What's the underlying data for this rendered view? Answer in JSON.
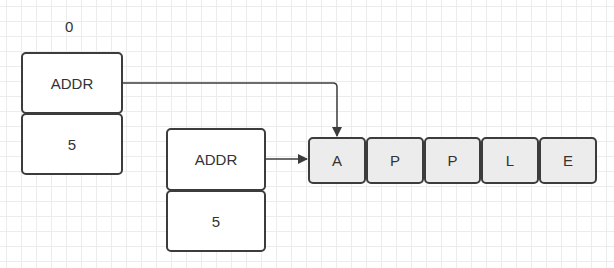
{
  "diagram": {
    "index_label": "0",
    "pointer_a": {
      "addr_label": "ADDR",
      "length": "5"
    },
    "pointer_b": {
      "addr_label": "ADDR",
      "length": "5"
    },
    "array": [
      "A",
      "P",
      "P",
      "L",
      "E"
    ],
    "colors": {
      "border": "#3c3c3c",
      "array_fill": "#ececec",
      "grid": "#ececec"
    }
  }
}
